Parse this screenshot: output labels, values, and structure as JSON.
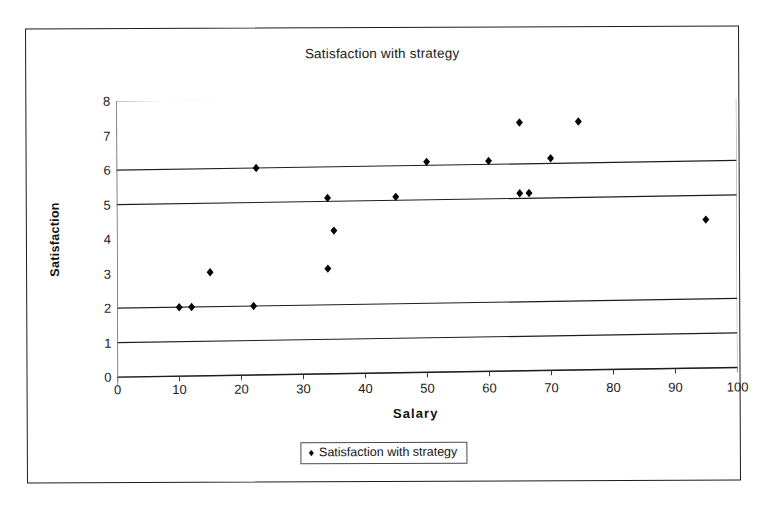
{
  "chart_data": {
    "type": "scatter",
    "title": "Satisfaction with strategy",
    "xlabel": "Salary",
    "ylabel": "Satisfaction",
    "xlim": [
      0,
      100
    ],
    "ylim": [
      0,
      8
    ],
    "xticks": [
      0,
      10,
      20,
      30,
      40,
      50,
      60,
      70,
      80,
      90,
      100
    ],
    "yticks": [
      0,
      1,
      2,
      3,
      4,
      5,
      6,
      7,
      8
    ],
    "grid": true,
    "gridlines_y": [
      0,
      1,
      2,
      5,
      6
    ],
    "legend_position": "bottom",
    "marker": "diamond",
    "marker_color": "#000000",
    "series": [
      {
        "name": "Satisfaction with strategy",
        "points": [
          {
            "x": 10,
            "y": 2.0
          },
          {
            "x": 12,
            "y": 2.0
          },
          {
            "x": 15,
            "y": 3.0
          },
          {
            "x": 22,
            "y": 2.0
          },
          {
            "x": 22.5,
            "y": 6.0
          },
          {
            "x": 34,
            "y": 3.05
          },
          {
            "x": 34,
            "y": 5.1
          },
          {
            "x": 35,
            "y": 4.15
          },
          {
            "x": 45,
            "y": 5.1
          },
          {
            "x": 50,
            "y": 6.1
          },
          {
            "x": 60,
            "y": 6.1
          },
          {
            "x": 65,
            "y": 5.15
          },
          {
            "x": 65,
            "y": 7.2
          },
          {
            "x": 66.5,
            "y": 5.15
          },
          {
            "x": 70,
            "y": 6.15
          },
          {
            "x": 74.5,
            "y": 7.2
          },
          {
            "x": 95,
            "y": 4.3
          }
        ]
      }
    ]
  },
  "legend": {
    "marker_glyph": "♦",
    "label": "Satisfaction with strategy"
  }
}
